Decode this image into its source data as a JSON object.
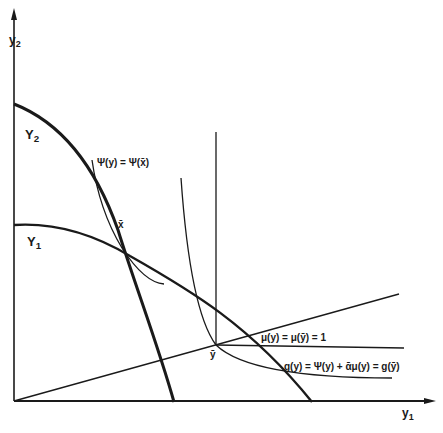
{
  "figure": {
    "axes": {
      "x_label": "y",
      "x_label_sub": "1",
      "y_label": "y",
      "y_label_sub": "2"
    },
    "curves": {
      "Y2": {
        "label": "Y",
        "sub": "2"
      },
      "Y1": {
        "label": "Y",
        "sub": "1"
      },
      "psi": {
        "label": "Ψ(y) = Ψ(x̄)"
      },
      "mu": {
        "label": "μ(y) = μ(ȳ) = 1"
      },
      "g": {
        "label": "g(y) = Ψ(y) + ᾱμ(y) = g(ȳ)"
      }
    },
    "points": {
      "x_bar": {
        "label": "x̄"
      },
      "y_bar": {
        "label": "ȳ"
      }
    },
    "colors": {
      "ink": "#1a1a1a",
      "background": "#ffffff"
    }
  }
}
